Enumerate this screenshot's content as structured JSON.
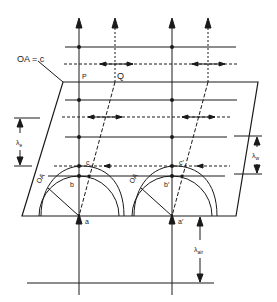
{
  "diagram": {
    "labels": {
      "optic_axis_eq": "OA = c",
      "P": "P",
      "Q": "Q",
      "oa_left": "OA",
      "oa_right": "OA",
      "a": "a",
      "b": "b",
      "c": "c",
      "a_prime": "a′",
      "b_prime": "b′",
      "c_prime": "c′",
      "lambda_e": "λ",
      "lambda_e_sub": "e",
      "lambda_o": "λ",
      "lambda_o_sub": "w",
      "lambda_air": "λ",
      "lambda_air_sub": "air"
    },
    "colors": {
      "stroke": "#1a1a1a",
      "background": "#ffffff"
    }
  }
}
